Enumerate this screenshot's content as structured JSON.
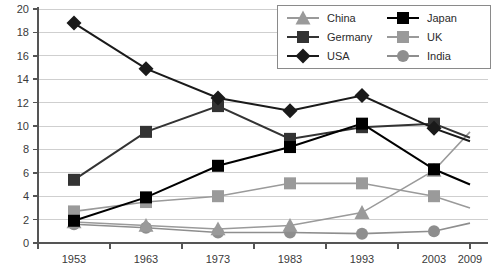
{
  "chart_data": {
    "type": "line",
    "title": "",
    "subtitle": "",
    "xlabel": "",
    "ylabel": "",
    "x": [
      1953,
      1963,
      1973,
      1983,
      1993,
      2003,
      2009
    ],
    "categories": [
      "1953",
      "1963",
      "1973",
      "1983",
      "1993",
      "2003",
      "2009"
    ],
    "xlim": [
      1953,
      2009
    ],
    "ylim": [
      0,
      20
    ],
    "yticks": [
      0,
      2,
      4,
      6,
      8,
      10,
      12,
      14,
      16,
      18,
      20
    ],
    "ytick_labels": [
      "0",
      "2",
      "4",
      "6",
      "8",
      "10",
      "12",
      "14",
      "16",
      "18",
      "20"
    ],
    "grid": true,
    "grid_axis": "y",
    "legend_position": "top-right",
    "series": [
      {
        "name": "China",
        "marker": "triangle",
        "color": "#9a9a9a",
        "line_color": "#9a9a9a",
        "values": [
          1.8,
          1.5,
          1.2,
          1.5,
          2.6,
          6.2,
          9.5
        ]
      },
      {
        "name": "Germany",
        "marker": "square",
        "color": "#333333",
        "line_color": "#333333",
        "values": [
          5.4,
          9.5,
          11.7,
          8.9,
          9.9,
          10.2,
          9.0
        ]
      },
      {
        "name": "USA",
        "marker": "diamond",
        "color": "#1a1a1a",
        "line_color": "#1a1a1a",
        "values": [
          18.8,
          14.9,
          12.4,
          11.3,
          12.6,
          9.8,
          8.7
        ]
      },
      {
        "name": "Japan",
        "marker": "square",
        "color": "#000000",
        "line_color": "#000000",
        "values": [
          1.9,
          3.9,
          6.6,
          8.2,
          10.2,
          6.3,
          5.0
        ]
      },
      {
        "name": "UK",
        "marker": "square",
        "color": "#9a9a9a",
        "line_color": "#9a9a9a",
        "values": [
          2.7,
          3.5,
          4.0,
          5.1,
          5.1,
          4.0,
          3.0
        ]
      },
      {
        "name": "India",
        "marker": "circle",
        "color": "#8e8e8e",
        "line_color": "#8e8e8e",
        "values": [
          1.6,
          1.3,
          0.9,
          0.9,
          0.8,
          1.0,
          1.7
        ]
      }
    ]
  },
  "legend": {
    "entries": [
      {
        "label": "China"
      },
      {
        "label": "Japan"
      },
      {
        "label": "Germany"
      },
      {
        "label": "UK"
      },
      {
        "label": "USA"
      },
      {
        "label": "India"
      }
    ]
  },
  "axes": {
    "y_tick_0": "0",
    "y_tick_1": "2",
    "y_tick_2": "4",
    "y_tick_3": "6",
    "y_tick_4": "8",
    "y_tick_5": "10",
    "y_tick_6": "12",
    "y_tick_7": "14",
    "y_tick_8": "16",
    "y_tick_9": "18",
    "y_tick_10": "20",
    "x_tick_0": "1953",
    "x_tick_1": "1963",
    "x_tick_2": "1973",
    "x_tick_3": "1983",
    "x_tick_4": "1993",
    "x_tick_5": "2003",
    "x_tick_6": "2009"
  },
  "colors": {
    "grid": "#cfcfcf",
    "axis": "#555555",
    "dark": "#1a1a1a",
    "mid_dark": "#333333",
    "gray": "#9a9a9a",
    "black": "#000000",
    "background": "#ffffff"
  }
}
